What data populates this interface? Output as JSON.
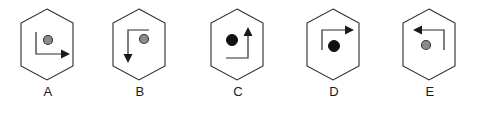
{
  "figure": {
    "title": "",
    "background_color": "#ffffff",
    "hexagon_stroke_color": "#2b2b2b",
    "arrow_stroke_color": "#2b2b2b",
    "dot_gray_fill": "#8c8c8c",
    "dot_gray_stroke": "#3a3a3a",
    "dot_black_fill": "#111111",
    "label_color": "#1a1a1a"
  },
  "options": [
    {
      "id": "A",
      "label": "A",
      "dot": {
        "shade": "gray",
        "fill": "#8c8c8c",
        "stroke": "#3a3a3a",
        "cx": 48,
        "cy": 36,
        "r": 4.5
      },
      "arrow": {
        "shape": "L",
        "description": "vertical segment downward from upper-left, then horizontal segment to the right",
        "direction": "right",
        "path": "M 36 28 L 36 50 L 61 50",
        "head_points": "61,45.5 70,50 61,54.5"
      }
    },
    {
      "id": "B",
      "label": "B",
      "dot": {
        "shade": "gray",
        "fill": "#8c8c8c",
        "stroke": "#3a3a3a",
        "cx": 52,
        "cy": 35,
        "r": 4.5
      },
      "arrow": {
        "shape": "L",
        "description": "horizontal segment to the left from upper-right, then vertical segment downward",
        "direction": "down",
        "path": "M 57 26 L 36 26 L 36 50",
        "head_points": "31.5,50 40.5,50 36,59"
      }
    },
    {
      "id": "C",
      "label": "C",
      "dot": {
        "shade": "black",
        "fill": "#111111",
        "stroke": "#111111",
        "cx": 42,
        "cy": 36,
        "r": 5.5
      },
      "arrow": {
        "shape": "L",
        "description": "horizontal segment to the right from lower-left, then vertical segment upward",
        "direction": "up",
        "path": "M 36 54 L 58 54 L 58 32",
        "head_points": "53.5,32 62.5,32 58,23"
      }
    },
    {
      "id": "D",
      "label": "D",
      "dot": {
        "shade": "black",
        "fill": "#111111",
        "stroke": "#111111",
        "cx": 48,
        "cy": 42,
        "r": 5.5
      },
      "arrow": {
        "shape": "L",
        "description": "vertical segment upward from lower-left, then horizontal segment to the right",
        "direction": "right",
        "path": "M 36 46 L 36 26 L 59 26",
        "head_points": "59,21.5 68,26 59,30.5"
      }
    },
    {
      "id": "E",
      "label": "E",
      "dot": {
        "shade": "gray",
        "fill": "#8c8c8c",
        "stroke": "#3a3a3a",
        "cx": 44,
        "cy": 41,
        "r": 4.5
      },
      "arrow": {
        "shape": "L",
        "description": "vertical segment upward from lower-right, then horizontal segment to the left",
        "direction": "left",
        "path": "M 62 46 L 62 26 L 40 26",
        "head_points": "40,21.5 40,30.5 31 26"
      }
    }
  ],
  "layout": {
    "option_positions_x": [
      0,
      92,
      190,
      286,
      382
    ],
    "hexagon_points": "47,5 73,19 73,62 47,76 21,62 21,19"
  }
}
